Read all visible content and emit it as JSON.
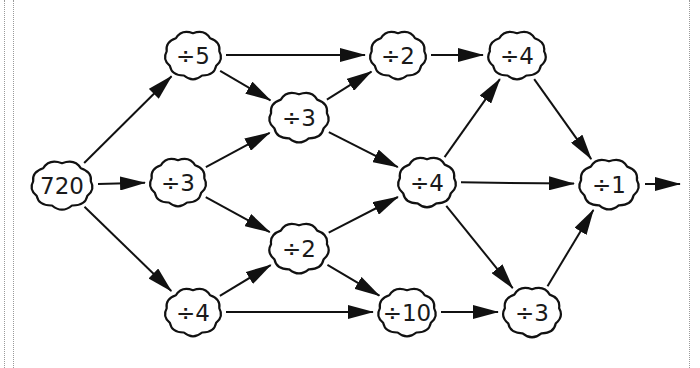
{
  "diagram": {
    "type": "division-path-network",
    "start_value": "720",
    "nodes": [
      {
        "id": "start",
        "label": "720",
        "x": 62,
        "y": 185,
        "rx": 34,
        "ry": 26
      },
      {
        "id": "n_div5",
        "label": "÷5",
        "x": 193,
        "y": 55,
        "rx": 31,
        "ry": 26
      },
      {
        "id": "n_div3_a",
        "label": "÷3",
        "x": 178,
        "y": 182,
        "rx": 31,
        "ry": 26
      },
      {
        "id": "n_div4_a",
        "label": "÷4",
        "x": 193,
        "y": 312,
        "rx": 31,
        "ry": 26
      },
      {
        "id": "n_div3_b",
        "label": "÷3",
        "x": 299,
        "y": 117,
        "rx": 33,
        "ry": 27
      },
      {
        "id": "n_div2_b",
        "label": "÷2",
        "x": 299,
        "y": 248,
        "rx": 33,
        "ry": 27
      },
      {
        "id": "n_div2_a",
        "label": "÷2",
        "x": 398,
        "y": 55,
        "rx": 31,
        "ry": 26
      },
      {
        "id": "n_div4_b",
        "label": "÷4",
        "x": 427,
        "y": 182,
        "rx": 32,
        "ry": 27
      },
      {
        "id": "n_div10",
        "label": "÷10",
        "x": 407,
        "y": 312,
        "rx": 32,
        "ry": 26
      },
      {
        "id": "n_div4_c",
        "label": "÷4",
        "x": 517,
        "y": 55,
        "rx": 32,
        "ry": 26
      },
      {
        "id": "n_div1",
        "label": "÷1",
        "x": 609,
        "y": 184,
        "rx": 33,
        "ry": 27
      },
      {
        "id": "n_div3_c",
        "label": "÷3",
        "x": 532,
        "y": 312,
        "rx": 32,
        "ry": 27
      }
    ],
    "edges": [
      {
        "from": "start",
        "to": "n_div5"
      },
      {
        "from": "start",
        "to": "n_div3_a"
      },
      {
        "from": "start",
        "to": "n_div4_a"
      },
      {
        "from": "n_div5",
        "to": "n_div2_a"
      },
      {
        "from": "n_div5",
        "to": "n_div3_b"
      },
      {
        "from": "n_div3_a",
        "to": "n_div3_b"
      },
      {
        "from": "n_div3_a",
        "to": "n_div2_b"
      },
      {
        "from": "n_div4_a",
        "to": "n_div2_b"
      },
      {
        "from": "n_div4_a",
        "to": "n_div10"
      },
      {
        "from": "n_div3_b",
        "to": "n_div2_a"
      },
      {
        "from": "n_div3_b",
        "to": "n_div4_b"
      },
      {
        "from": "n_div2_b",
        "to": "n_div4_b"
      },
      {
        "from": "n_div2_b",
        "to": "n_div10"
      },
      {
        "from": "n_div2_a",
        "to": "n_div4_c"
      },
      {
        "from": "n_div4_b",
        "to": "n_div4_c"
      },
      {
        "from": "n_div4_b",
        "to": "n_div1"
      },
      {
        "from": "n_div4_b",
        "to": "n_div3_c"
      },
      {
        "from": "n_div10",
        "to": "n_div3_c"
      },
      {
        "from": "n_div4_c",
        "to": "n_div1"
      },
      {
        "from": "n_div3_c",
        "to": "n_div1"
      }
    ],
    "exit_arrow": {
      "from": "n_div1",
      "x1": 645,
      "y1": 184,
      "x2": 680,
      "y2": 184
    },
    "colors": {
      "stroke": "#111111",
      "fill": "#ffffff",
      "text": "#1a1a1a",
      "border_dots": "#9a9a9a"
    }
  }
}
